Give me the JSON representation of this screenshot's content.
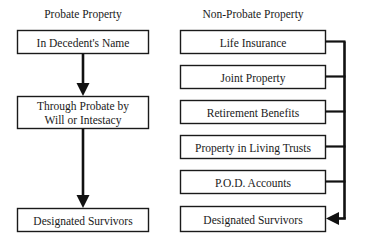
{
  "diagram": {
    "title_left": "Probate Property",
    "title_right": "Non-Probate Property",
    "left_column": {
      "heading": "Probate Property",
      "nodes": [
        {
          "id": "in-decedents-name",
          "label": "In Decedent's Name",
          "lines": [
            "In Decedent's Name"
          ]
        },
        {
          "id": "through-probate",
          "label": "Through Probate by Will or Intestacy",
          "lines": [
            "Through Probate by",
            "Will or Intestacy"
          ]
        },
        {
          "id": "designated-survivors-left",
          "label": "Designated Survivors",
          "lines": [
            "Designated Survivors"
          ]
        }
      ],
      "connectors": [
        {
          "from": "in-decedents-name",
          "to": "through-probate",
          "direction": "down",
          "arrow": true
        },
        {
          "from": "through-probate",
          "to": "designated-survivors-left",
          "direction": "down",
          "arrow": true
        }
      ]
    },
    "right_column": {
      "heading": "Non-Probate Property",
      "nodes": [
        {
          "id": "life-insurance",
          "label": "Life Insurance",
          "lines": [
            "Life Insurance"
          ]
        },
        {
          "id": "joint-property",
          "label": "Joint Property",
          "lines": [
            "Joint Property"
          ]
        },
        {
          "id": "retirement-benefits",
          "label": "Retirement Benefits",
          "lines": [
            "Retirement Benefits"
          ]
        },
        {
          "id": "property-in-living-trusts",
          "label": "Property in Living Trusts",
          "lines": [
            "Property in Living Trusts"
          ]
        },
        {
          "id": "pod-accounts",
          "label": "P.O.D. Accounts",
          "lines": [
            "P.O.D. Accounts"
          ]
        },
        {
          "id": "designated-survivors-right",
          "label": "Designated Survivors",
          "lines": [
            "Designated Survivors"
          ]
        }
      ],
      "connectors": [
        {
          "from": "life-insurance",
          "to": "bus",
          "direction": "right",
          "arrow": false
        },
        {
          "from": "joint-property",
          "to": "bus",
          "direction": "right",
          "arrow": false
        },
        {
          "from": "retirement-benefits",
          "to": "bus",
          "direction": "right",
          "arrow": false
        },
        {
          "from": "property-in-living-trusts",
          "to": "bus",
          "direction": "right",
          "arrow": false
        },
        {
          "from": "pod-accounts",
          "to": "bus",
          "direction": "right",
          "arrow": false
        },
        {
          "from": "bus",
          "to": "designated-survivors-right",
          "direction": "left",
          "arrow": true
        }
      ]
    },
    "colors": {
      "background": "#ffffff",
      "text": "#1a1a1a",
      "box_border": "#1a1a1a",
      "connector": "#111111"
    }
  }
}
